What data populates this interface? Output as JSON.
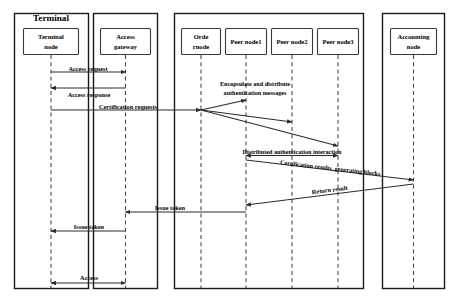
{
  "diagram": {
    "type": "uml-sequence-diagram",
    "title": "",
    "groups": [
      {
        "id": "terminal",
        "label": "Terminal"
      },
      {
        "id": "gateway",
        "label": ""
      },
      {
        "id": "blockchain",
        "label": ""
      },
      {
        "id": "accounting",
        "label": ""
      }
    ],
    "participants": [
      {
        "id": "terminal-node",
        "label_line1": "Terminal",
        "label_line2": "node"
      },
      {
        "id": "access-gateway",
        "label_line1": "Access",
        "label_line2": "gateway"
      },
      {
        "id": "order-node",
        "label_line1": "Orde",
        "label_line2": "rnode"
      },
      {
        "id": "peer-node-1",
        "label_line1": "Peer node1",
        "label_line2": ""
      },
      {
        "id": "peer-node-2",
        "label_line1": "Peer node2",
        "label_line2": ""
      },
      {
        "id": "peer-node-3",
        "label_line1": "Peer node3",
        "label_line2": ""
      },
      {
        "id": "accounting-node",
        "label_line1": "Accounting",
        "label_line2": "node"
      }
    ],
    "messages": [
      {
        "id": "access-request",
        "label": "Access request",
        "from": "terminal-node",
        "to": "access-gateway",
        "direction": "right"
      },
      {
        "id": "access-response",
        "label": "Access response",
        "from": "access-gateway",
        "to": "terminal-node",
        "direction": "left"
      },
      {
        "id": "certification-requests",
        "label": "Certification requests",
        "from": "terminal-node",
        "to": "order-node",
        "direction": "right"
      },
      {
        "id": "encapsulate-distribute",
        "label_line1": "Encapsulate and distribute",
        "label_line2": "authentication messages",
        "from": "order-node",
        "to": "peer-node-1,peer-node-2,peer-node-3",
        "direction": "right"
      },
      {
        "id": "distributed-authentication-interaction",
        "label": "Distributed authentication interaction",
        "from": "peer-node-1",
        "to": "peer-node-3",
        "direction": "both"
      },
      {
        "id": "certification-results",
        "label": "Certification results, generating blocks",
        "from": "peer-node-1",
        "to": "accounting-node",
        "direction": "right"
      },
      {
        "id": "return-result",
        "label": "Return result",
        "from": "accounting-node",
        "to": "peer-node-1",
        "direction": "left"
      },
      {
        "id": "issue-token-gateway",
        "label": "Issue token",
        "from": "peer-node-1",
        "to": "access-gateway",
        "direction": "left"
      },
      {
        "id": "issue-token-terminal",
        "label": "Issue token",
        "from": "access-gateway",
        "to": "terminal-node",
        "direction": "left"
      },
      {
        "id": "access",
        "label": "Access",
        "from": "terminal-node",
        "to": "access-gateway",
        "direction": "both"
      }
    ],
    "colors": {
      "frame_stroke": "#1a1a1a",
      "node_stroke": "#3a3a3a",
      "lifeline_stroke": "#4a4a4a",
      "message_stroke": "#2b2b2b",
      "background": "#ffffff",
      "text": "#000000"
    }
  }
}
